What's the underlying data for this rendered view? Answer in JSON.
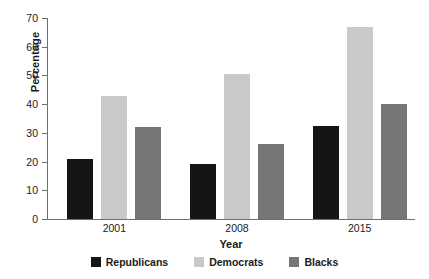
{
  "chart_data": {
    "type": "bar",
    "title": "",
    "xlabel": "Year",
    "ylabel": "Percentage",
    "categories": [
      "2001",
      "2008",
      "2015"
    ],
    "series": [
      {
        "name": "Republicans",
        "color": "#151515",
        "values": [
          21,
          19,
          32.5
        ]
      },
      {
        "name": "Democrats",
        "color": "#c9c9c9",
        "values": [
          43,
          50.5,
          67
        ]
      },
      {
        "name": "Blacks",
        "color": "#767676",
        "values": [
          32,
          26,
          40
        ]
      }
    ],
    "ylim": [
      0,
      70
    ],
    "yticks": [
      0,
      10,
      20,
      30,
      40,
      50,
      60,
      70
    ],
    "ytick_labels": [
      "0",
      "10",
      "20",
      "30",
      "40",
      "50",
      "60",
      "70"
    ],
    "grid": false,
    "legend_position": "bottom"
  }
}
